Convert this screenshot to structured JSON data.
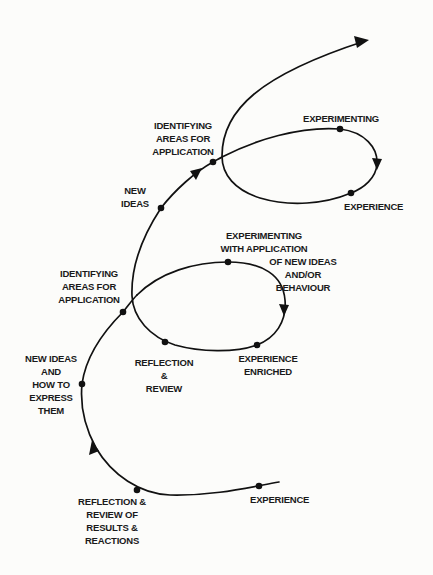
{
  "diagram": {
    "type": "experiential-learning-spiral",
    "colors": {
      "line": "#111111",
      "background": "#fcfcfa",
      "text": "#1a1a1a"
    },
    "labels": {
      "experience_start": "EXPERIENCE",
      "reflection_review_results": "REFLECTION &\nREVIEW OF\nRESULTS &\nREACTIONS",
      "new_ideas_express": "NEW IDEAS\nAND\nHOW TO\nEXPRESS\nTHEM",
      "identifying_areas_1": "IDENTIFYING\nAREAS FOR\nAPPLICATION",
      "experimenting_with_application": "EXPERIMENTING\nWITH APPLICATION",
      "of_new_ideas": "OF NEW IDEAS\nAND/OR\nBEHAVIOUR",
      "experience_enriched": "EXPERIENCE\nENRICHED",
      "reflection_review": "REFLECTION\n&\nREVIEW",
      "new_ideas": "NEW\nIDEAS",
      "identifying_areas_2": "IDENTIFYING\nAREAS FOR\nAPPLICATION",
      "experimenting": "EXPERIMENTING",
      "experience_top": "EXPERIENCE"
    },
    "nodes": [
      {
        "id": "experience-start",
        "x": 259,
        "y": 486
      },
      {
        "id": "reflection-review-results",
        "x": 137,
        "y": 490
      },
      {
        "id": "new-ideas-express",
        "x": 82,
        "y": 384
      },
      {
        "id": "identifying-areas-1",
        "x": 123,
        "y": 312
      },
      {
        "id": "reflection-review",
        "x": 165,
        "y": 342
      },
      {
        "id": "experimenting-with-application",
        "x": 228,
        "y": 262
      },
      {
        "id": "experience-enriched",
        "x": 257,
        "y": 345
      },
      {
        "id": "new-ideas",
        "x": 161,
        "y": 208
      },
      {
        "id": "identifying-areas-2",
        "x": 213,
        "y": 162
      },
      {
        "id": "experimenting",
        "x": 340,
        "y": 129
      },
      {
        "id": "experience-top",
        "x": 351,
        "y": 193
      }
    ]
  }
}
